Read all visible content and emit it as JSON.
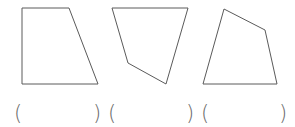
{
  "figure": {
    "stroke_color": "#5a5a5a",
    "shapes": [
      {
        "name": "quadrilateral-1",
        "type": "trapezoid",
        "points": "22,8 69,8 98,84 22,84"
      },
      {
        "name": "quadrilateral-2",
        "type": "quadrilateral",
        "points": "112,8 188,8 166,84 128,63"
      },
      {
        "name": "quadrilateral-3",
        "type": "quadrilateral",
        "points": "224,9 265,30 277,84 203,84"
      }
    ]
  },
  "answers": [
    {
      "open": "(",
      "close": ")",
      "value": ""
    },
    {
      "open": "(",
      "close": ")",
      "value": ""
    },
    {
      "open": "(",
      "close": ")",
      "value": ""
    }
  ]
}
